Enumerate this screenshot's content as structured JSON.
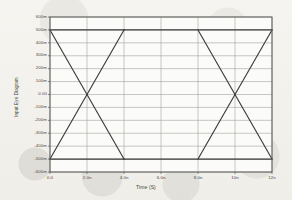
{
  "chart_data": {
    "type": "line",
    "title": "",
    "xlabel": "Time (S)",
    "ylabel": "Input Eye Diagram",
    "xlim": [
      0,
      12
    ],
    "ylim": [
      -0.6,
      0.6
    ],
    "grid": true,
    "legend_position": "none",
    "x_unit": "ns",
    "y_unit": "V",
    "x_ticks": [
      {
        "value": 0,
        "label": "0.0"
      },
      {
        "value": 2,
        "label": "2.0n"
      },
      {
        "value": 4,
        "label": "4.0n"
      },
      {
        "value": 6,
        "label": "6.0n"
      },
      {
        "value": 8,
        "label": "8.0n"
      },
      {
        "value": 10,
        "label": "10n"
      },
      {
        "value": 12,
        "label": "12n"
      }
    ],
    "y_ticks": [
      {
        "value": 0.6,
        "label": "600m"
      },
      {
        "value": 0.5,
        "label": "500m"
      },
      {
        "value": 0.4,
        "label": "400m"
      },
      {
        "value": 0.3,
        "label": "300m"
      },
      {
        "value": 0.2,
        "label": "200m"
      },
      {
        "value": 0.1,
        "label": "100m"
      },
      {
        "value": 0.0,
        "label": "0.00"
      },
      {
        "value": -0.1,
        "label": "-100m"
      },
      {
        "value": -0.2,
        "label": "-200m"
      },
      {
        "value": -0.3,
        "label": "-300m"
      },
      {
        "value": -0.4,
        "label": "-400m"
      },
      {
        "value": -0.5,
        "label": "-500m"
      },
      {
        "value": -0.6,
        "label": "-600m"
      }
    ],
    "high_level": 0.5,
    "low_level": -0.5,
    "crossing_level": 0.0,
    "trace_color": "#3c3c3c",
    "grid_color": "#9a9a98",
    "frame_color": "#5a5a58",
    "background_color": "#f3f2ee",
    "series": [
      {
        "name": "eye-trace-high-falling",
        "points": [
          [
            0,
            0.5
          ],
          [
            4,
            -0.5
          ]
        ]
      },
      {
        "name": "eye-trace-low-rising",
        "points": [
          [
            0,
            -0.5
          ],
          [
            4,
            0.5
          ]
        ]
      },
      {
        "name": "eye-trace-high-hold-left",
        "points": [
          [
            0,
            0.5
          ],
          [
            4,
            0.5
          ]
        ]
      },
      {
        "name": "eye-trace-low-hold-left",
        "points": [
          [
            0,
            -0.5
          ],
          [
            4,
            -0.5
          ]
        ]
      },
      {
        "name": "eye-trace-high-falling-2",
        "points": [
          [
            8,
            0.5
          ],
          [
            12,
            -0.5
          ]
        ]
      },
      {
        "name": "eye-trace-low-rising-2",
        "points": [
          [
            8,
            -0.5
          ],
          [
            12,
            0.5
          ]
        ]
      },
      {
        "name": "eye-trace-high-hold-right",
        "points": [
          [
            4,
            0.5
          ],
          [
            12,
            0.5
          ]
        ]
      },
      {
        "name": "eye-trace-low-hold-right",
        "points": [
          [
            4,
            -0.5
          ],
          [
            12,
            -0.5
          ]
        ]
      }
    ]
  }
}
